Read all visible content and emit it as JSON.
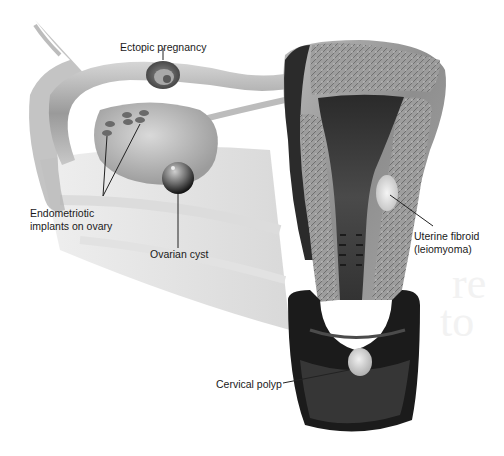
{
  "figure": {
    "type": "anatomical-illustration",
    "labels": [
      {
        "id": "ectopic",
        "text": "Ectopic pregnancy"
      },
      {
        "id": "endometriotic",
        "lines": [
          "Endometriotic",
          "implants on ovary"
        ]
      },
      {
        "id": "ovarian",
        "text": "Ovarian cyst"
      },
      {
        "id": "fibroid",
        "lines": [
          "Uterine fibroid",
          "(leiomyoma)"
        ]
      },
      {
        "id": "polyp",
        "text": "Cervical polyp"
      }
    ]
  },
  "colors": {
    "background": "#ffffff",
    "label_text": "#1a1a1a",
    "leader_line": "#222222",
    "tissue_light": "#c9c9c9",
    "tissue_mid": "#8a8a8a",
    "tissue_dark": "#2a2a2a"
  }
}
